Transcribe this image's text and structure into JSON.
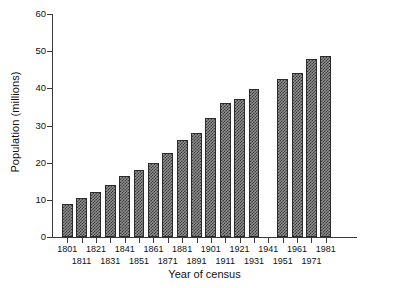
{
  "chart_data": {
    "type": "bar",
    "title": "",
    "subtitle": "",
    "xlabel": "Year of census",
    "ylabel": "Population (millions)",
    "categories": [
      "1801",
      "1811",
      "1821",
      "1831",
      "1841",
      "1851",
      "1861",
      "1871",
      "1881",
      "1891",
      "1901",
      "1911",
      "1921",
      "1931",
      "1941",
      "1951",
      "1961",
      "1971",
      "1981"
    ],
    "values": [
      9.0,
      10.5,
      12.0,
      14.0,
      16.3,
      17.9,
      20.0,
      22.5,
      26.0,
      28.0,
      32.0,
      36.0,
      37.0,
      39.8,
      null,
      42.5,
      44.0,
      47.8,
      48.6
    ],
    "missing_note": "1941 tick present but no bar (no census taken)",
    "ylim": [
      0,
      60
    ],
    "yticks": [
      0,
      10,
      20,
      30,
      40,
      50,
      60
    ],
    "ytick_labels": [
      "0",
      "10",
      "20",
      "30",
      "40",
      "50",
      "60"
    ],
    "grid": false,
    "legend": null,
    "bar_style": {
      "fill_pattern": "checkerboard",
      "fill_dark": "#3c3c3c",
      "fill_light": "#8f8f8f",
      "edge_color": "#2b2b2b"
    },
    "axis_color": "#3a3a3a",
    "background": "#ffffff"
  }
}
